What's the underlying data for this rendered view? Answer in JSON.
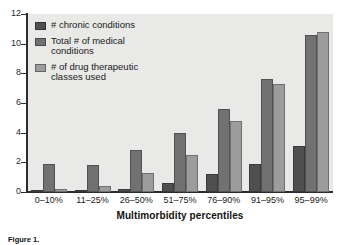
{
  "chart_data": {
    "type": "bar",
    "title": "",
    "xlabel": "Multimorbidity percentiles",
    "ylabel": "",
    "ylim": [
      0,
      12
    ],
    "yticks": [
      0,
      2,
      4,
      6,
      8,
      10,
      12
    ],
    "grid": false,
    "legend_position": "top-left",
    "categories": [
      "0–10%",
      "11–25%",
      "26–50%",
      "51–75%",
      "76–90%",
      "91–95%",
      "95–99%"
    ],
    "series": [
      {
        "name": "# chronic conditions",
        "color": "#4f4f4f",
        "values": [
          0.1,
          0.1,
          0.2,
          0.6,
          1.2,
          1.9,
          3.1
        ]
      },
      {
        "name": "Total # of medical conditions",
        "color": "#717171",
        "values": [
          1.9,
          1.8,
          2.8,
          4.0,
          5.6,
          7.6,
          10.6
        ]
      },
      {
        "name": "# of drug therapeutic classes used",
        "color": "#9c9c9c",
        "values": [
          0.2,
          0.4,
          1.3,
          2.5,
          4.8,
          7.3,
          10.8
        ]
      }
    ]
  },
  "legend": {
    "items": [
      {
        "label": "# chronic conditions",
        "color": "#4f4f4f"
      },
      {
        "label": "Total # of medical conditions",
        "color": "#717171"
      },
      {
        "label": "# of drug therapeutic classes used",
        "color": "#9c9c9c"
      }
    ]
  },
  "axes": {
    "y_labels": [
      "12",
      "10",
      "8",
      "6",
      "4",
      "2",
      "0"
    ],
    "x_title": "Multimorbidity percentiles"
  },
  "caption": {
    "label": "Figure 1.",
    "text": "Figure 1."
  },
  "colors": {
    "panel_background": "#e9e9e7",
    "axis": "#2b2b2b",
    "text": "#1a1a1a",
    "series_dark": "#4f4f4f",
    "series_medium": "#717171",
    "series_light": "#9c9c9c"
  }
}
